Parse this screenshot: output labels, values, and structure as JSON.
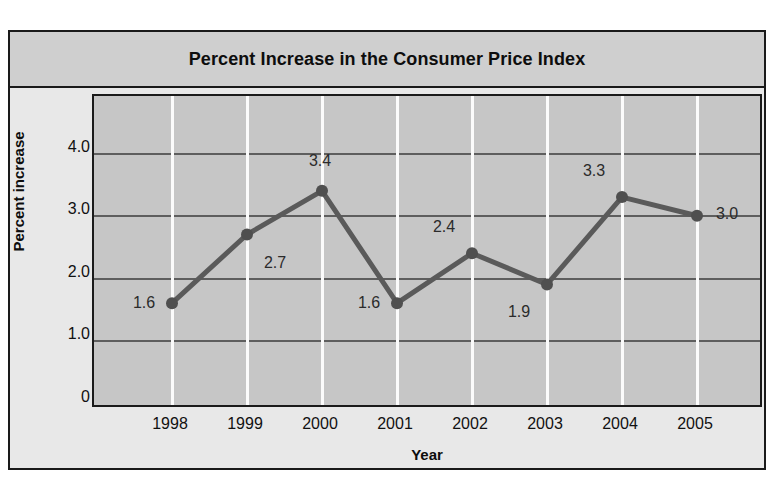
{
  "chart_data": {
    "type": "line",
    "title": "Percent Increase in the Consumer Price Index",
    "xlabel": "Year",
    "ylabel": "Percent increase",
    "categories": [
      "1998",
      "1999",
      "2000",
      "2001",
      "2002",
      "2003",
      "2004",
      "2005"
    ],
    "values": [
      1.6,
      2.7,
      3.4,
      1.6,
      2.4,
      1.9,
      3.3,
      3.0
    ],
    "point_labels": [
      "1.6",
      "2.7",
      "3.4",
      "1.6",
      "2.4",
      "1.9",
      "3.3",
      "3.0"
    ],
    "label_positions": [
      "left",
      "below-right",
      "above",
      "left",
      "above-left",
      "below-left",
      "above-left",
      "right"
    ],
    "ylim": [
      0,
      4.5
    ],
    "yticks": [
      "0",
      "1.0",
      "2.0",
      "3.0",
      "4.0"
    ],
    "ytick_values": [
      0,
      1.0,
      2.0,
      3.0,
      4.0
    ],
    "grid": "horizontal gridlines dark gray, vertical gridlines white",
    "legend": "none",
    "colors": {
      "line": "#5a5a5a",
      "marker": "#4f4f4f",
      "plot_background": "#c6c6c6",
      "title_band": "#cfcfcf",
      "figure_background": "#e8e8e8",
      "border": "#1a1a1a",
      "hgrid": "#5e5e5e",
      "vgrid": "#fbfbfb"
    }
  }
}
